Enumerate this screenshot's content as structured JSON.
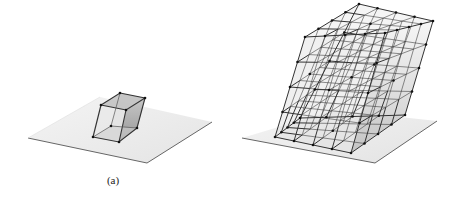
{
  "figure": {
    "panels": [
      {
        "id": "a",
        "caption": "(a)",
        "description": "Single sheared hexahedral element resting on a ground plane"
      },
      {
        "id": "b",
        "caption": "(b)",
        "description": "Sheared 4x4x4 lattice of hexahedral elements resting on a ground plane"
      }
    ],
    "colors": {
      "background": "#ffffff",
      "plane_fill": "#ececec",
      "plane_edge": "#555555",
      "edge": "#333333",
      "node": "#111111",
      "face_shade_light": "#e2e2e2",
      "face_shade_dark": "#a9a9a9"
    }
  }
}
